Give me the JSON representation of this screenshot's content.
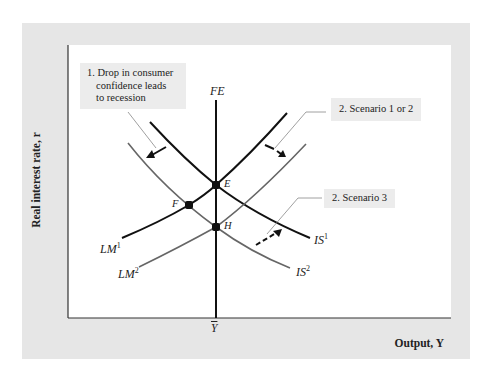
{
  "axes": {
    "ylabel": "Real interest rate, r",
    "xlabel": "Output, Y",
    "x_tick": "Y"
  },
  "callouts": {
    "c1_line1": "1. Drop in consumer",
    "c1_line2": "confidence leads",
    "c1_line3": "to recession",
    "c2": "2. Scenario 1 or 2",
    "c3": "2. Scenario 3"
  },
  "curves": {
    "fe": "FE",
    "lm1_base": "LM",
    "lm1_sup": "1",
    "lm2_base": "LM",
    "lm2_sup": "2",
    "is1_base": "IS",
    "is1_sup": "1",
    "is2_base": "IS",
    "is2_sup": "2"
  },
  "points": {
    "e": "E",
    "f": "F",
    "h": "H"
  },
  "colors": {
    "frame": "#e6e6e6",
    "curve_primary": "#111111",
    "curve_secondary": "#666666",
    "callout_bg": "#ececec"
  }
}
